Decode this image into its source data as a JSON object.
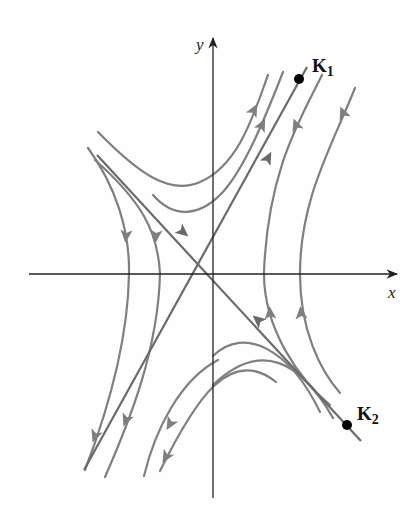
{
  "figure": {
    "axes": {
      "x_label": "x",
      "y_label": "y",
      "origin": [
        213,
        274
      ],
      "x_axis": {
        "from": [
          29,
          274
        ],
        "to": [
          397,
          274
        ]
      },
      "y_axis": {
        "from": [
          213,
          498
        ],
        "to": [
          213,
          38
        ]
      }
    },
    "eigenvectors": [
      {
        "name": "K",
        "subscript": "1",
        "point": [
          299,
          79
        ],
        "line_from": [
          84,
          470
        ],
        "line_to": [
          307,
          67
        ],
        "direction": "outward"
      },
      {
        "name": "K",
        "subscript": "2",
        "point": [
          347,
          425
        ],
        "line_from": [
          97,
          155
        ],
        "line_to": [
          361,
          441
        ],
        "direction": "inward"
      }
    ],
    "colors": {
      "trajectory": "#7f7f7f",
      "eigenline": "#6a6a6a",
      "axis": "#222222",
      "point": "#000000",
      "background": "#fefefe"
    },
    "trajectories": [
      {
        "id": "upper-1",
        "d": "M98,132 C140,175 170,195 200,182 C240,165 255,110 268,75",
        "arrows": [
          [
            254,
            110,
            -62
          ]
        ]
      },
      {
        "id": "upper-2",
        "d": "M153,195 C175,220 200,215 220,195 C245,170 268,110 283,72",
        "arrows": [
          [
            262,
            125,
            -63
          ]
        ]
      },
      {
        "id": "upper-3",
        "d": "M322,75 C300,120 268,170 264,272 L264,274",
        "arrows": [
          [
            296,
            125,
            -110
          ]
        ]
      },
      {
        "id": "upper-4",
        "d": "M355,88 C330,150 300,200 300,274",
        "arrows": [
          [
            343,
            113,
            -112
          ]
        ]
      },
      {
        "id": "left-1",
        "d": "M88,148 C115,185 130,230 129,274",
        "arrows": [
          [
            126,
            236,
            95
          ]
        ]
      },
      {
        "id": "left-2",
        "d": "M95,160 C140,200 158,230 160,274",
        "arrows": [
          [
            156,
            236,
            95
          ]
        ]
      },
      {
        "id": "lower-left-1",
        "d": "M129,274 C128,340 108,410 85,470",
        "arrows": [
          [
            95,
            436,
            110
          ]
        ]
      },
      {
        "id": "lower-left-2",
        "d": "M160,274 C158,350 130,420 105,477",
        "arrows": [
          [
            126,
            420,
            112
          ]
        ]
      },
      {
        "id": "lower-left-3",
        "d": "M218,360 C180,380 155,430 144,476",
        "arrows": [
          [
            170,
            424,
            120
          ]
        ]
      },
      {
        "id": "lower-left-4",
        "d": "M276,382 C230,345 195,400 160,471",
        "arrows": [
          [
            166,
            457,
            120
          ]
        ]
      },
      {
        "id": "right-1",
        "d": "M264,274 C264,330 300,380 330,405",
        "arrows": [
          [
            270,
            313,
            -95
          ]
        ]
      },
      {
        "id": "right-2",
        "d": "M300,274 C300,330 320,370 340,393",
        "arrows": [
          [
            301,
            313,
            -95
          ]
        ]
      },
      {
        "id": "lower-right-1",
        "d": "M213,356 C245,325 290,350 320,412",
        "arrows": []
      },
      {
        "id": "lower-right-2",
        "d": "M213,385 C260,340 300,360 333,418",
        "arrows": []
      }
    ],
    "eigen_arrows": [
      [
        268,
        158,
        -62
      ],
      [
        183,
        232,
        40
      ],
      [
        258,
        320,
        -140
      ]
    ]
  }
}
